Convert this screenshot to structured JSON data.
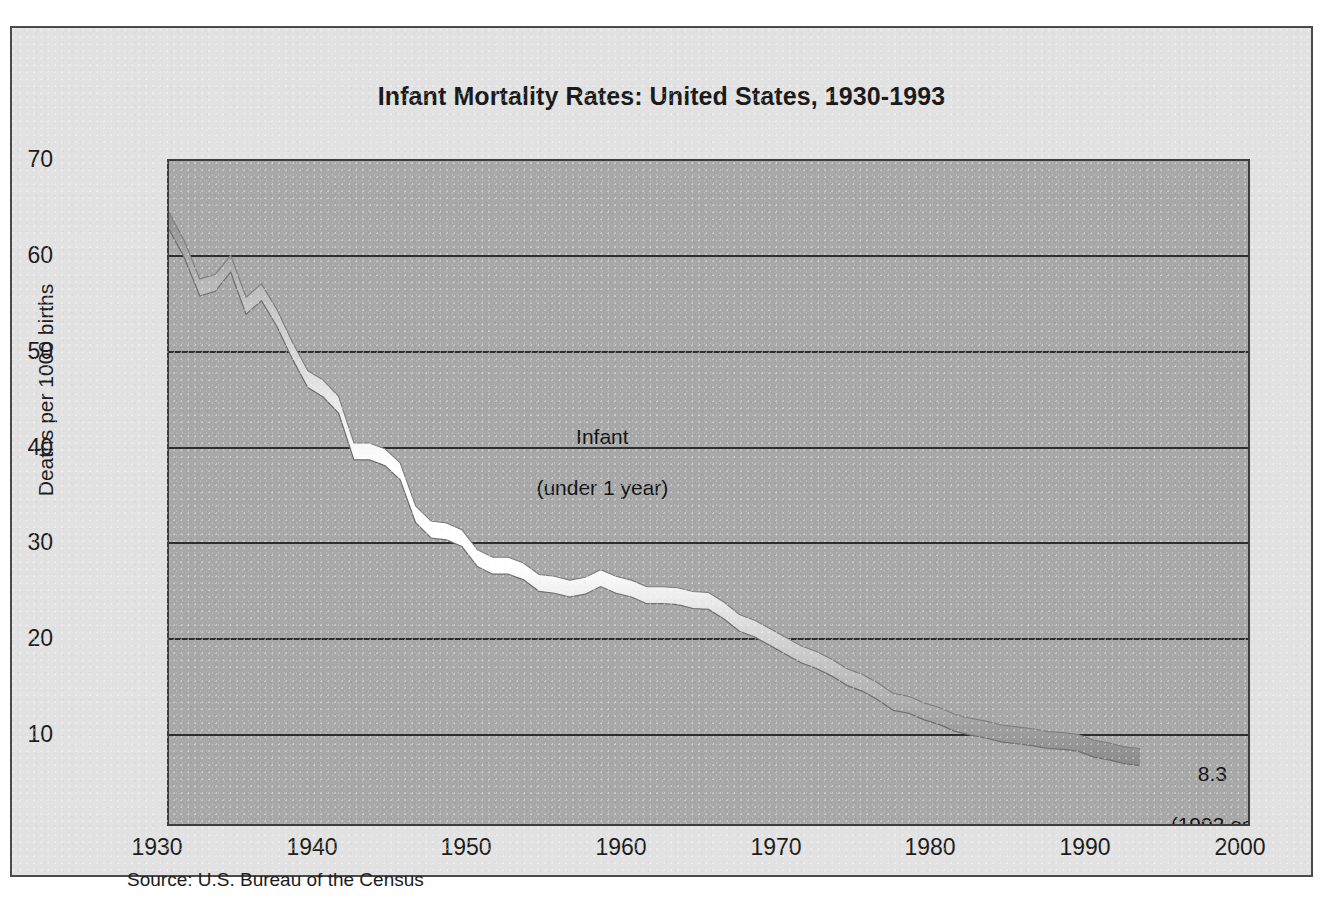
{
  "figure": {
    "title": "Infant Mortality Rates:  United States, 1930-1993",
    "source": "Source:  U.S. Bureau of the Census",
    "ylabel": "Deaths per 1000 births",
    "plate_color": "#e2e2e2",
    "plot_color": "#a8a8a8",
    "border_color": "#3d3d3d",
    "ribbon_color": "#ffffff"
  },
  "annotations": {
    "series_label": "Infant\n(under 1 year)",
    "series_label_line1": "Infant",
    "series_label_line2": "(under 1 year)",
    "endpoint_value": "8.3",
    "endpoint_note": "(1993 est.)"
  },
  "chart_data": {
    "type": "line",
    "title": "Infant Mortality Rates:  United States, 1930-1993",
    "subtitle": "",
    "xlabel": "",
    "ylabel": "Deaths per 1000 births",
    "xlim": [
      1930,
      2000
    ],
    "ylim": [
      0.4,
      70
    ],
    "xticks": [
      1930,
      1940,
      1950,
      1960,
      1970,
      1980,
      1990,
      2000
    ],
    "yticks": [
      10,
      20,
      30,
      40,
      50,
      60,
      70
    ],
    "grid": "horizontal",
    "legend": "none",
    "series": [
      {
        "name": "Infant (under 1 year)",
        "x": [
          1930,
          1931,
          1932,
          1933,
          1934,
          1935,
          1936,
          1937,
          1938,
          1939,
          1940,
          1941,
          1942,
          1943,
          1944,
          1945,
          1946,
          1947,
          1948,
          1949,
          1950,
          1951,
          1952,
          1953,
          1954,
          1955,
          1956,
          1957,
          1958,
          1959,
          1960,
          1961,
          1962,
          1963,
          1964,
          1965,
          1966,
          1967,
          1968,
          1969,
          1970,
          1971,
          1972,
          1973,
          1974,
          1975,
          1976,
          1977,
          1978,
          1979,
          1980,
          1981,
          1982,
          1983,
          1984,
          1985,
          1986,
          1987,
          1988,
          1989,
          1990,
          1991,
          1992,
          1993
        ],
        "y": [
          64.6,
          61.6,
          57.6,
          58.1,
          60.1,
          55.7,
          57.1,
          54.4,
          51.0,
          48.0,
          47.0,
          45.3,
          40.4,
          40.4,
          39.8,
          38.3,
          33.8,
          32.2,
          32.0,
          31.3,
          29.2,
          28.4,
          28.4,
          27.8,
          26.6,
          26.4,
          26.0,
          26.3,
          27.1,
          26.4,
          26.0,
          25.3,
          25.3,
          25.2,
          24.8,
          24.7,
          23.7,
          22.4,
          21.8,
          20.9,
          20.0,
          19.1,
          18.5,
          17.7,
          16.7,
          16.1,
          15.2,
          14.1,
          13.8,
          13.1,
          12.6,
          11.9,
          11.5,
          11.2,
          10.8,
          10.6,
          10.4,
          10.1,
          10.0,
          9.8,
          9.2,
          8.9,
          8.5,
          8.3
        ],
        "endpoint_label": "8.3",
        "endpoint_note": "(1993 est.)",
        "style": "thick-ribbon",
        "color": "#ffffff"
      }
    ]
  }
}
